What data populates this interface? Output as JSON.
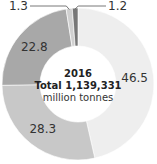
{
  "chart_data": {
    "type": "pie",
    "variant": "donut",
    "title": "2016",
    "subtitle": "Total 1,139,331",
    "unit": "million tonnes",
    "categories": [
      "A",
      "B",
      "C",
      "D",
      "E"
    ],
    "values": [
      46.5,
      28.3,
      22.8,
      1.3,
      1.2
    ],
    "labels": [
      "46.5",
      "28.3",
      "22.8",
      "1.3",
      "1.2"
    ],
    "colors": [
      "#eeeeee",
      "#c8c8c8",
      "#a8a8a8",
      "#d0d0d0",
      "#777777"
    ],
    "legend": "none"
  },
  "center": {
    "year": "2016",
    "total": "Total 1,139,331",
    "unit": "million tonnes"
  }
}
